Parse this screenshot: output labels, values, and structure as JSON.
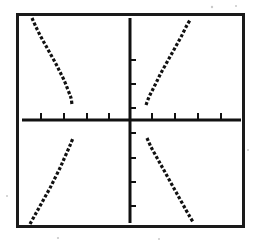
{
  "figure": {
    "title": "",
    "kind": "calculator-graph-screen",
    "background_color": "#ffffff",
    "ink_color": "#111111",
    "frame": {
      "name": "plot-border",
      "x": 16,
      "y": 13,
      "width": 229,
      "height": 215,
      "stroke_color": "#1a1a1a",
      "stroke_width": 3
    }
  },
  "chart_data": {
    "type": "line",
    "title": "",
    "subtitle": "",
    "xlabel": "",
    "ylabel": "",
    "grid": false,
    "legend": null,
    "legend_position": "none",
    "tick_labels_shown": false,
    "axis_labels_shown": false,
    "origin_px": {
      "x": 130,
      "y": 120
    },
    "xlim": [
      -5,
      5
    ],
    "ylim": [
      -4.5,
      4.5
    ],
    "xticks": [
      -4,
      -3,
      -2,
      -1,
      1,
      2,
      3,
      4
    ],
    "yticks": [
      -3,
      -2,
      -1,
      1,
      2,
      3
    ],
    "xtick_px": [
      41,
      64,
      87,
      109,
      152,
      175,
      198,
      221
    ],
    "ytick_px": [
      60,
      84,
      108,
      133,
      158,
      182,
      206
    ],
    "curve_style": "dashed",
    "series": [
      {
        "name": "branch-upper-left",
        "quadrant": 2,
        "points_px": [
          [
            32,
            18
          ],
          [
            36,
            27
          ],
          [
            41,
            37
          ],
          [
            46,
            46
          ],
          [
            51,
            55
          ],
          [
            56,
            64
          ],
          [
            60,
            72
          ],
          [
            64,
            80
          ],
          [
            68,
            90
          ],
          [
            71,
            98
          ],
          [
            72,
            105
          ]
        ],
        "x": [
          -4.3,
          -4.2,
          -4.0,
          -3.8,
          -3.6,
          -3.3,
          -3.1,
          -2.9,
          -2.7,
          -2.6,
          -2.6
        ],
        "y": [
          4.3,
          4.0,
          3.6,
          3.2,
          2.8,
          2.4,
          2.1,
          1.7,
          1.3,
          0.9,
          0.6
        ]
      },
      {
        "name": "branch-upper-right",
        "quadrant": 1,
        "points_px": [
          [
            146,
            105
          ],
          [
            149,
            97
          ],
          [
            153,
            89
          ],
          [
            157,
            81
          ],
          [
            161,
            73
          ],
          [
            166,
            64
          ],
          [
            171,
            55
          ],
          [
            176,
            46
          ],
          [
            181,
            37
          ],
          [
            186,
            27
          ],
          [
            190,
            20
          ]
        ],
        "x": [
          0.7,
          0.8,
          0.9,
          1.1,
          1.3,
          1.5,
          1.7,
          2.0,
          2.2,
          2.4,
          2.6
        ],
        "y": [
          0.6,
          1.0,
          1.3,
          1.7,
          2.0,
          2.4,
          2.8,
          3.2,
          3.6,
          4.0,
          4.3
        ]
      },
      {
        "name": "branch-lower-left",
        "quadrant": 3,
        "points_px": [
          [
            30,
            224
          ],
          [
            35,
            215
          ],
          [
            40,
            206
          ],
          [
            45,
            197
          ],
          [
            50,
            188
          ],
          [
            55,
            178
          ],
          [
            60,
            168
          ],
          [
            64,
            159
          ],
          [
            68,
            150
          ],
          [
            71,
            143
          ],
          [
            73,
            138
          ]
        ],
        "x": [
          -4.4,
          -4.2,
          -4.0,
          -3.8,
          -3.6,
          -3.3,
          -3.1,
          -2.9,
          -2.7,
          -2.6,
          -2.5
        ],
        "y": [
          -4.3,
          -4.0,
          -3.6,
          -3.2,
          -2.8,
          -2.4,
          -2.0,
          -1.7,
          -1.3,
          -1.0,
          -0.7
        ]
      },
      {
        "name": "branch-lower-right",
        "quadrant": 4,
        "points_px": [
          [
            147,
            138
          ],
          [
            151,
            147
          ],
          [
            156,
            156
          ],
          [
            161,
            165
          ],
          [
            166,
            174
          ],
          [
            171,
            183
          ],
          [
            176,
            192
          ],
          [
            181,
            201
          ],
          [
            186,
            210
          ],
          [
            190,
            217
          ],
          [
            193,
            222
          ]
        ],
        "x": [
          0.7,
          0.9,
          1.1,
          1.3,
          1.5,
          1.7,
          2.0,
          2.2,
          2.4,
          2.6,
          2.7
        ],
        "y": [
          -0.7,
          -1.1,
          -1.4,
          -1.8,
          -2.2,
          -2.6,
          -3.0,
          -3.4,
          -3.8,
          -4.1,
          -4.3
        ]
      }
    ]
  },
  "axes": {
    "x_axis": {
      "name": "x-axis",
      "x1": 22,
      "x2": 241,
      "y": 120
    },
    "y_axis": {
      "name": "y-axis",
      "y1": 18,
      "y2": 223,
      "x": 130
    }
  }
}
